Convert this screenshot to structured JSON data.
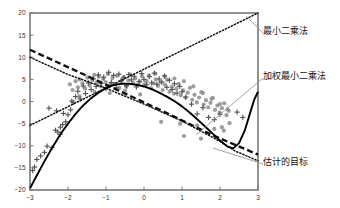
{
  "chart_data": {
    "type": "scatter",
    "title": "",
    "xlabel": "",
    "ylabel": "",
    "xlim": [
      -3,
      3
    ],
    "ylim": [
      -20,
      20
    ],
    "xticks": [
      -3,
      -2,
      -1,
      0,
      1,
      2,
      3
    ],
    "yticks": [
      -20,
      -15,
      -10,
      -5,
      0,
      5,
      10,
      15,
      20
    ],
    "xtick_labels": [
      "−3",
      "−2",
      "−1",
      "0",
      "1",
      "2",
      "3"
    ],
    "ytick_labels": [
      "−20",
      "−15",
      "−10",
      "−5",
      "0",
      "5",
      "10",
      "15",
      "20"
    ],
    "grid": false,
    "legend_position": "annotations-right",
    "colors": {
      "outlier_marker": "#555555",
      "inlier_marker": "#8c8c8c",
      "least_squares_line": "#111111",
      "weighted_least_squares_curve": "#000000",
      "target_curve": "#111111",
      "axis": "#777777",
      "leader_line": "#999999"
    },
    "series": [
      {
        "name": "inliers",
        "marker": "circle",
        "color": "#8c8c8c",
        "points": [
          [
            -1.95,
            3.9
          ],
          [
            -1.88,
            2.6
          ],
          [
            -1.8,
            4.6
          ],
          [
            -1.74,
            3.2
          ],
          [
            -1.69,
            5.0
          ],
          [
            -1.62,
            4.1
          ],
          [
            -1.55,
            2.9
          ],
          [
            -1.49,
            5.4
          ],
          [
            -1.43,
            3.6
          ],
          [
            -1.37,
            4.9
          ],
          [
            -1.31,
            6.0
          ],
          [
            -1.25,
            4.3
          ],
          [
            -1.19,
            5.6
          ],
          [
            -1.13,
            3.4
          ],
          [
            -1.07,
            5.1
          ],
          [
            -1.01,
            4.4
          ],
          [
            -0.95,
            6.2
          ],
          [
            -0.89,
            3.8
          ],
          [
            -0.83,
            5.3
          ],
          [
            -0.77,
            4.0
          ],
          [
            -0.71,
            5.8
          ],
          [
            -0.65,
            3.1
          ],
          [
            -0.59,
            4.7
          ],
          [
            -0.53,
            5.5
          ],
          [
            -0.47,
            3.3
          ],
          [
            -0.41,
            4.8
          ],
          [
            -0.35,
            6.1
          ],
          [
            -0.29,
            4.2
          ],
          [
            -0.23,
            5.2
          ],
          [
            -0.17,
            3.7
          ],
          [
            -0.11,
            4.5
          ],
          [
            -0.05,
            5.7
          ],
          [
            0.01,
            3.9
          ],
          [
            0.07,
            4.6
          ],
          [
            0.13,
            5.9
          ],
          [
            0.19,
            3.0
          ],
          [
            0.25,
            4.1
          ],
          [
            0.31,
            5.0
          ],
          [
            0.37,
            3.5
          ],
          [
            0.43,
            4.4
          ],
          [
            0.49,
            2.6
          ],
          [
            0.55,
            3.8
          ],
          [
            0.61,
            4.9
          ],
          [
            0.67,
            2.2
          ],
          [
            0.73,
            3.3
          ],
          [
            0.79,
            1.8
          ],
          [
            0.85,
            2.9
          ],
          [
            0.91,
            4.0
          ],
          [
            0.97,
            1.4
          ],
          [
            1.03,
            2.5
          ],
          [
            1.09,
            0.9
          ],
          [
            1.15,
            2.0
          ],
          [
            1.21,
            3.1
          ],
          [
            1.27,
            0.4
          ],
          [
            1.33,
            1.5
          ],
          [
            1.39,
            -0.2
          ],
          [
            1.45,
            0.9
          ],
          [
            1.51,
            2.1
          ],
          [
            1.57,
            -0.7
          ],
          [
            1.63,
            0.3
          ],
          [
            1.69,
            -1.3
          ],
          [
            1.75,
            -0.3
          ],
          [
            1.81,
            0.8
          ],
          [
            1.87,
            -1.9
          ],
          [
            1.93,
            -0.9
          ],
          [
            1.99,
            -2.5
          ],
          [
            2.05,
            -1.5
          ],
          [
            2.11,
            -0.4
          ],
          [
            2.17,
            -3.1
          ],
          [
            2.23,
            -2.1
          ],
          [
            0.3,
            6.3
          ],
          [
            0.55,
            5.6
          ],
          [
            0.8,
            5.2
          ],
          [
            1.05,
            4.6
          ],
          [
            1.3,
            3.4
          ],
          [
            1.55,
            1.9
          ],
          [
            1.78,
            0.6
          ],
          [
            2.0,
            -0.6
          ],
          [
            2.2,
            -1.8
          ],
          [
            0.45,
            -4.6
          ],
          [
            0.95,
            -5.0
          ],
          [
            1.4,
            -5.4
          ],
          [
            1.85,
            -6.2
          ],
          [
            2.1,
            -6.6
          ],
          [
            1.05,
            -7.8
          ],
          [
            1.5,
            -8.4
          ],
          [
            2.05,
            -5.8
          ],
          [
            2.25,
            -4.9
          ],
          [
            -1.7,
            1.2
          ],
          [
            -1.3,
            2.2
          ],
          [
            -0.9,
            1.9
          ],
          [
            -0.5,
            2.4
          ],
          [
            -0.1,
            1.6
          ]
        ]
      },
      {
        "name": "outliers",
        "marker": "plus",
        "color": "#555555",
        "points": [
          [
            -2.93,
            -15.6
          ],
          [
            -2.88,
            -14.8
          ],
          [
            -2.82,
            -13.1
          ],
          [
            -2.72,
            -12.3
          ],
          [
            -2.62,
            -11.5
          ],
          [
            -2.55,
            -10.1
          ],
          [
            -2.42,
            -10.4
          ],
          [
            -2.33,
            -6.5
          ],
          [
            -2.27,
            -6.9
          ],
          [
            -2.2,
            -5.8
          ],
          [
            -2.14,
            -5.2
          ],
          [
            -2.06,
            -4.6
          ],
          [
            -2.3,
            -2.1
          ],
          [
            -2.0,
            -3.0
          ],
          [
            -1.93,
            -1.9
          ],
          [
            -1.86,
            -0.2
          ],
          [
            -1.8,
            1.1
          ],
          [
            -1.74,
            2.3
          ],
          [
            -1.68,
            0.6
          ],
          [
            -1.6,
            3.5
          ],
          [
            -1.54,
            1.8
          ],
          [
            -1.46,
            4.2
          ],
          [
            -1.39,
            2.7
          ],
          [
            -1.33,
            5.1
          ],
          [
            -1.26,
            3.4
          ],
          [
            -1.2,
            6.0
          ],
          [
            -1.13,
            4.1
          ],
          [
            -1.06,
            5.5
          ],
          [
            -1.0,
            2.9
          ],
          [
            -0.93,
            6.6
          ],
          [
            -0.86,
            4.3
          ],
          [
            -0.8,
            5.9
          ],
          [
            -0.73,
            3.1
          ],
          [
            -0.66,
            6.2
          ],
          [
            -0.6,
            4.7
          ],
          [
            -0.53,
            5.4
          ],
          [
            -0.46,
            3.6
          ],
          [
            -0.4,
            6.1
          ],
          [
            -0.33,
            4.9
          ],
          [
            -0.26,
            5.7
          ],
          [
            -0.2,
            3.3
          ],
          [
            -0.13,
            4.5
          ],
          [
            -0.06,
            6.3
          ],
          [
            0.0,
            5.0
          ],
          [
            0.07,
            3.8
          ],
          [
            0.14,
            5.6
          ],
          [
            0.2,
            4.2
          ],
          [
            0.27,
            6.4
          ],
          [
            0.34,
            3.9
          ],
          [
            0.4,
            5.1
          ],
          [
            0.47,
            4.4
          ],
          [
            0.54,
            5.8
          ],
          [
            0.6,
            3.2
          ],
          [
            0.67,
            4.8
          ],
          [
            0.74,
            2.7
          ],
          [
            0.8,
            4.0
          ],
          [
            0.87,
            1.9
          ],
          [
            0.94,
            3.4
          ],
          [
            1.0,
            2.2
          ],
          [
            1.1,
            1.0
          ],
          [
            1.25,
            -0.6
          ],
          [
            1.4,
            -2.8
          ],
          [
            1.55,
            -1.4
          ],
          [
            1.7,
            -3.6
          ],
          [
            1.85,
            -4.1
          ],
          [
            2.0,
            -2.9
          ],
          [
            -2.5,
            -1.5
          ],
          [
            -2.2,
            -7.4
          ],
          [
            -2.12,
            -2.7
          ],
          [
            -1.9,
            0.1
          ],
          [
            2.45,
            -2.4
          ],
          [
            2.6,
            -3.6
          ]
        ]
      }
    ],
    "curves": [
      {
        "name": "least_squares_line",
        "label": "最小二乘法",
        "style": "dotted",
        "color": "#111111",
        "description": "ascending straight line from (-3,-5.4) to (3,20)",
        "points": [
          [
            -3,
            -5.4
          ],
          [
            3,
            20.0
          ]
        ]
      },
      {
        "name": "target_curve",
        "label": "估计的目标",
        "style": "dashed",
        "color": "#111111",
        "description": "descending dashed line from (-3,11.7) to (3,-12.0)",
        "points": [
          [
            -3,
            11.7
          ],
          [
            -1.2,
            4.6
          ],
          [
            0.4,
            -1.8
          ],
          [
            1.8,
            -7.6
          ],
          [
            3,
            -12.0
          ]
        ]
      },
      {
        "name": "target_dotted",
        "label": "估计的目标",
        "style": "dotted",
        "color": "#111111",
        "description": "descending dotted curve from (-3,10.0) to (3,-13.4)",
        "points": [
          [
            -3,
            10.0
          ],
          [
            -2.0,
            6.1
          ],
          [
            -1.0,
            3.0
          ],
          [
            0.0,
            -0.6
          ],
          [
            1.0,
            -4.4
          ],
          [
            2.0,
            -9.0
          ],
          [
            2.4,
            -11.2
          ],
          [
            3,
            -13.4
          ]
        ]
      },
      {
        "name": "weighted_least_squares_curve",
        "label": "加权最小二乘法",
        "style": "solid",
        "color": "#000000",
        "description": "steep rise from (-3,-19.6), peak ~4.0 near x=-0.6, decline to minimum ~-10.6 at x=2.25, then sharp rise to 2.2 at x=3",
        "points": [
          [
            -3,
            -19.6
          ],
          [
            -2.8,
            -16.4
          ],
          [
            -2.6,
            -13.2
          ],
          [
            -2.4,
            -10.2
          ],
          [
            -2.2,
            -7.4
          ],
          [
            -2.0,
            -5.0
          ],
          [
            -1.8,
            -2.8
          ],
          [
            -1.6,
            -0.9
          ],
          [
            -1.4,
            0.7
          ],
          [
            -1.2,
            2.0
          ],
          [
            -1.0,
            3.0
          ],
          [
            -0.8,
            3.7
          ],
          [
            -0.6,
            4.0
          ],
          [
            -0.4,
            4.0
          ],
          [
            -0.2,
            3.8
          ],
          [
            0.0,
            3.4
          ],
          [
            0.2,
            2.8
          ],
          [
            0.4,
            2.0
          ],
          [
            0.6,
            1.1
          ],
          [
            0.8,
            0.1
          ],
          [
            1.0,
            -1.1
          ],
          [
            1.2,
            -2.5
          ],
          [
            1.4,
            -4.0
          ],
          [
            1.6,
            -5.6
          ],
          [
            1.8,
            -7.2
          ],
          [
            2.0,
            -8.8
          ],
          [
            2.2,
            -10.2
          ],
          [
            2.35,
            -10.6
          ],
          [
            2.5,
            -9.4
          ],
          [
            2.65,
            -6.6
          ],
          [
            2.8,
            -2.4
          ],
          [
            2.9,
            0.4
          ],
          [
            3.0,
            2.2
          ]
        ]
      }
    ],
    "annotations": [
      {
        "id": "ann-ls",
        "text": "最小二乘法",
        "anchor_data": [
          2.85,
          18.8
        ],
        "leader_from": [
          263,
          33
        ],
        "leader_to": [
          246,
          16
        ]
      },
      {
        "id": "ann-wls",
        "text": "加权最小二乘法",
        "anchor_data": [
          1.75,
          -7.0
        ],
        "leader_from": [
          263,
          78
        ],
        "leader_to": [
          196,
          135
        ]
      },
      {
        "id": "ann-target",
        "text": "估计的目标",
        "anchor_data": [
          2.05,
          -10.6
        ],
        "leader_from": [
          263,
          164
        ],
        "leader_to": [
          213,
          148
        ]
      }
    ]
  }
}
